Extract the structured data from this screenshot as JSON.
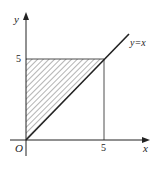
{
  "diagram": {
    "labels": {
      "y_axis": "y",
      "x_axis": "x",
      "origin": "O",
      "y_tick": "5",
      "x_tick": "5",
      "line": "y=x"
    },
    "region": "triangle bounded by x=0, y=5, y=x (hatched)",
    "colors": {
      "stroke": "#222222",
      "hatch": "#444444"
    }
  }
}
